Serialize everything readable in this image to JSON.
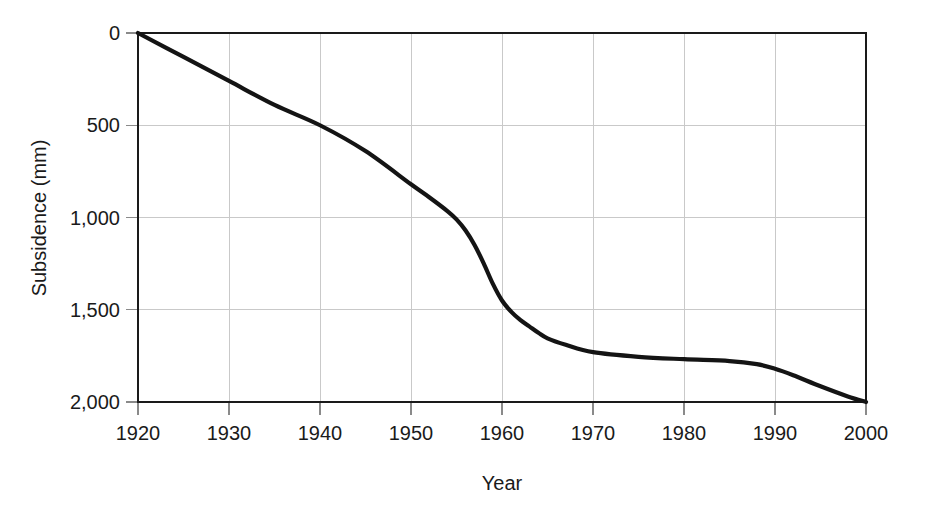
{
  "chart_data": {
    "type": "line",
    "title": "",
    "xlabel": "Year",
    "ylabel": "Subsidence (mm)",
    "xlim": [
      1920,
      2000
    ],
    "ylim": [
      0,
      2000
    ],
    "y_inverted": true,
    "grid": true,
    "legend": null,
    "x_ticks": [
      1920,
      1930,
      1940,
      1950,
      1960,
      1970,
      1980,
      1990,
      2000
    ],
    "x_tick_labels": [
      "1920",
      "1930",
      "1940",
      "1950",
      "1960",
      "1970",
      "1980",
      "1990",
      "2000"
    ],
    "y_ticks": [
      0,
      500,
      1000,
      1500,
      2000
    ],
    "y_tick_labels": [
      "0",
      "500",
      "1,000",
      "1,500",
      "2,000"
    ],
    "series": [
      {
        "name": "Cumulative subsidence",
        "color": "#141414",
        "x": [
          1920,
          1925,
          1930,
          1935,
          1940,
          1945,
          1950,
          1952,
          1954,
          1955,
          1956,
          1957,
          1958,
          1959,
          1960,
          1961,
          1962,
          1963,
          1964,
          1965,
          1967,
          1970,
          1975,
          1980,
          1985,
          1988,
          1990,
          1992,
          1995,
          1998,
          2000
        ],
        "values": [
          0,
          130,
          260,
          390,
          500,
          640,
          820,
          890,
          965,
          1010,
          1070,
          1150,
          1250,
          1360,
          1450,
          1510,
          1555,
          1590,
          1625,
          1655,
          1690,
          1730,
          1755,
          1768,
          1778,
          1795,
          1820,
          1855,
          1915,
          1970,
          2000
        ]
      }
    ]
  },
  "axis_style": {
    "grid_color": "#c9c9c9",
    "frame_color": "#1a1a1a",
    "text_color": "#1a1a1a",
    "background": "#ffffff"
  }
}
